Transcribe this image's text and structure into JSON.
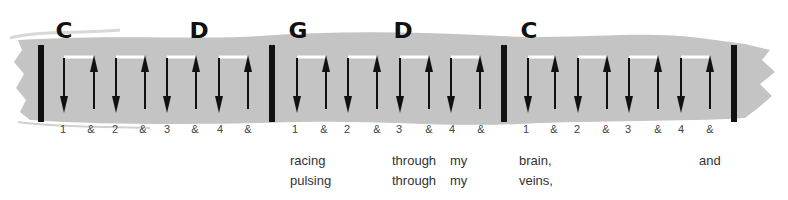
{
  "diagram": {
    "colors": {
      "brush": "#c4c4c4",
      "ink": "#111111",
      "text": "#333333",
      "bracket": "#ffffff"
    },
    "measures": [
      {
        "chords": [
          {
            "name": "C",
            "x": 56
          },
          {
            "name": "D",
            "x": 190
          }
        ],
        "strums": [
          {
            "dir": "down",
            "x": 64
          },
          {
            "dir": "up",
            "x": 94
          },
          {
            "dir": "down",
            "x": 116
          },
          {
            "dir": "up",
            "x": 145
          },
          {
            "dir": "down",
            "x": 167
          },
          {
            "dir": "up",
            "x": 196
          },
          {
            "dir": "down",
            "x": 219
          },
          {
            "dir": "up",
            "x": 248
          }
        ],
        "beats": [
          {
            "label": "1",
            "x": 63
          },
          {
            "label": "&",
            "x": 91
          },
          {
            "label": "2",
            "x": 115
          },
          {
            "label": "&",
            "x": 143
          },
          {
            "label": "3",
            "x": 167
          },
          {
            "label": "&",
            "x": 195
          },
          {
            "label": "4",
            "x": 220
          },
          {
            "label": "&",
            "x": 248
          }
        ]
      },
      {
        "chords": [
          {
            "name": "G",
            "x": 289
          },
          {
            "name": "D",
            "x": 394
          }
        ],
        "strums": [
          {
            "dir": "down",
            "x": 297
          },
          {
            "dir": "up",
            "x": 326
          },
          {
            "dir": "down",
            "x": 348
          },
          {
            "dir": "up",
            "x": 377
          },
          {
            "dir": "down",
            "x": 400
          },
          {
            "dir": "up",
            "x": 429
          },
          {
            "dir": "down",
            "x": 451
          },
          {
            "dir": "up",
            "x": 480
          }
        ],
        "beats": [
          {
            "label": "1",
            "x": 295
          },
          {
            "label": "&",
            "x": 324
          },
          {
            "label": "2",
            "x": 347
          },
          {
            "label": "&",
            "x": 377
          },
          {
            "label": "3",
            "x": 399
          },
          {
            "label": "&",
            "x": 429
          },
          {
            "label": "4",
            "x": 452
          },
          {
            "label": "&",
            "x": 481
          }
        ]
      },
      {
        "chords": [
          {
            "name": "C",
            "x": 521
          }
        ],
        "strums": [
          {
            "dir": "down",
            "x": 528
          },
          {
            "dir": "up",
            "x": 555
          },
          {
            "dir": "down",
            "x": 578
          },
          {
            "dir": "up",
            "x": 607
          },
          {
            "dir": "down",
            "x": 629
          },
          {
            "dir": "up",
            "x": 658
          },
          {
            "dir": "down",
            "x": 681
          },
          {
            "dir": "up",
            "x": 710
          }
        ],
        "beats": [
          {
            "label": "1",
            "x": 526
          },
          {
            "label": "&",
            "x": 554
          },
          {
            "label": "2",
            "x": 577
          },
          {
            "label": "&",
            "x": 606
          },
          {
            "label": "3",
            "x": 628
          },
          {
            "label": "&",
            "x": 658
          },
          {
            "label": "4",
            "x": 681
          },
          {
            "label": "&",
            "x": 710
          }
        ]
      }
    ],
    "barlines": [
      38,
      269,
      501,
      731
    ],
    "lyrics": [
      [
        {
          "text": "racing",
          "x": 290
        },
        {
          "text": "through",
          "x": 392
        },
        {
          "text": "my",
          "x": 450
        },
        {
          "text": "brain,",
          "x": 519
        },
        {
          "text": "and",
          "x": 699
        }
      ],
      [
        {
          "text": "pulsing",
          "x": 290
        },
        {
          "text": "through",
          "x": 392
        },
        {
          "text": "my",
          "x": 450
        },
        {
          "text": "veins,",
          "x": 519
        }
      ]
    ]
  }
}
